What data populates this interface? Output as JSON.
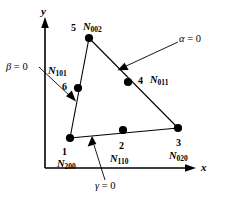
{
  "figure": {
    "axes": {
      "x_label": "x",
      "y_label": "y"
    },
    "nodes": [
      {
        "id": "1",
        "number": "1",
        "shape_fn_base": "N",
        "shape_fn_sub": "200",
        "x": 70,
        "y": 138
      },
      {
        "id": "2",
        "number": "2",
        "shape_fn_base": "N",
        "shape_fn_sub": "110",
        "x": 123,
        "y": 130
      },
      {
        "id": "3",
        "number": "3",
        "shape_fn_base": "N",
        "shape_fn_sub": "020",
        "x": 178,
        "y": 128
      },
      {
        "id": "4",
        "number": "4",
        "shape_fn_base": "N",
        "shape_fn_sub": "011",
        "x": 128,
        "y": 82
      },
      {
        "id": "5",
        "number": "5",
        "shape_fn_base": "N",
        "shape_fn_sub": "002",
        "x": 89,
        "y": 38
      },
      {
        "id": "6",
        "number": "6",
        "shape_fn_base": "N",
        "shape_fn_sub": "101",
        "x": 78,
        "y": 88
      }
    ],
    "annotations": [
      {
        "id": "alpha",
        "symbol": "α",
        "equals": "= 0"
      },
      {
        "id": "beta",
        "symbol": "β",
        "equals": "= 0"
      },
      {
        "id": "gamma",
        "symbol": "γ",
        "equals": "= 0"
      }
    ],
    "colors": {
      "stroke": "#000000",
      "background": "#ffffff",
      "node_fill": "#000000"
    }
  }
}
